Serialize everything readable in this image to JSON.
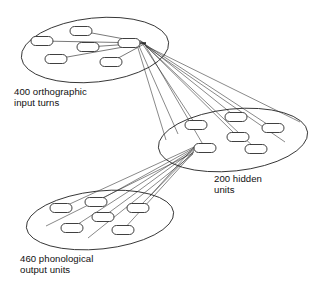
{
  "figure": {
    "type": "neural-network-architecture-diagram",
    "background_color": "#ffffff",
    "stroke_color": "#2a2a2a",
    "text_color": "#111111",
    "width": 322,
    "height": 291
  },
  "layers": [
    {
      "id": "orthographic-input",
      "label_line1": "400 orthographic",
      "label_line2": "input turns",
      "label_x": 14,
      "label_y": 95,
      "ellipse": {
        "cx": 95,
        "cy": 50,
        "rx": 74,
        "ry": 32,
        "rotation": -6
      },
      "unit_count_visible": 6,
      "units": [
        {
          "x": 81,
          "y": 31
        },
        {
          "x": 42,
          "y": 41
        },
        {
          "x": 88,
          "y": 47
        },
        {
          "x": 129,
          "y": 43
        },
        {
          "x": 56,
          "y": 59
        },
        {
          "x": 111,
          "y": 62
        }
      ]
    },
    {
      "id": "hidden",
      "label_line1": "200 hidden",
      "label_line2": "units",
      "label_x": 214,
      "label_y": 182,
      "ellipse": {
        "cx": 233,
        "cy": 140,
        "rx": 75,
        "ry": 31,
        "rotation": -6
      },
      "unit_count_visible": 6,
      "units": [
        {
          "x": 196,
          "y": 125
        },
        {
          "x": 236,
          "y": 117
        },
        {
          "x": 273,
          "y": 128
        },
        {
          "x": 238,
          "y": 137
        },
        {
          "x": 205,
          "y": 148
        },
        {
          "x": 256,
          "y": 149
        }
      ]
    },
    {
      "id": "phonological-output",
      "label_line1": "460 phonological",
      "label_line2": "output units",
      "label_x": 20,
      "label_y": 262,
      "ellipse": {
        "cx": 100,
        "cy": 220,
        "rx": 74,
        "ry": 29,
        "rotation": -6
      },
      "unit_count_visible": 6,
      "units": [
        {
          "x": 61,
          "y": 208
        },
        {
          "x": 96,
          "y": 202
        },
        {
          "x": 138,
          "y": 208
        },
        {
          "x": 103,
          "y": 217
        },
        {
          "x": 72,
          "y": 228
        },
        {
          "x": 123,
          "y": 230
        }
      ]
    }
  ],
  "node_style": {
    "width": 22,
    "height": 9,
    "corner_radius": 4.5
  },
  "connections": {
    "input_to_hidden_fan_origin": {
      "x": 146,
      "y": 43
    },
    "input_to_hidden_count": 9,
    "hidden_to_output_fan_origin": {
      "x": 194,
      "y": 149
    },
    "hidden_to_output_count": 9,
    "input_unit_feed_count": 5,
    "output_unit_feed_count": 5
  }
}
